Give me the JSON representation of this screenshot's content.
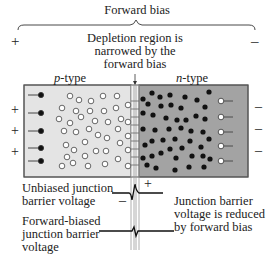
{
  "title": "Forward bias",
  "polarity": {
    "left": "+",
    "right": "–"
  },
  "callout_top": [
    "Depletion region is",
    "narrowed by the",
    "forward bias"
  ],
  "regions": {
    "p": {
      "label_italic": "p",
      "label_rest": "-type",
      "color": "#e4e4e4"
    },
    "n": {
      "label_italic": "n",
      "label_rest": "-type",
      "color": "#a3a3a3"
    }
  },
  "left_terminals": [
    "+",
    "+",
    "+"
  ],
  "right_terminals": [
    "–",
    "–",
    "–"
  ],
  "labels": {
    "unbiased": [
      "Unbiased junction",
      "barrier voltage"
    ],
    "forward_biased": [
      "Forward-biased",
      "junction barrier",
      "voltage"
    ],
    "reduced": [
      "Junction barrier",
      "voltage is reduced",
      "by forward bias"
    ],
    "barrier_minus": "–",
    "barrier_plus": "+"
  },
  "colors": {
    "border": "#555555",
    "hole_fill": "#ffffff",
    "electron_fill": "#111111",
    "junction": "#f2f2f2"
  }
}
